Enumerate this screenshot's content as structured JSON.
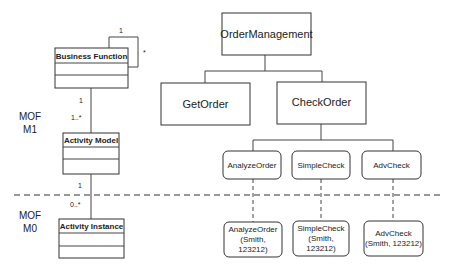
{
  "levels": [
    {
      "line1": "MOF",
      "line2": "M1"
    },
    {
      "line1": "MOF",
      "line2": "M0"
    }
  ],
  "classes": {
    "business_function": "Business Function",
    "activity_model": "Activity Model",
    "activity_instance": "Activity Instance"
  },
  "multiplicities": {
    "self_loop_top": "1",
    "self_loop_side": "*",
    "bf_am_upper": "1",
    "bf_am_lower": "1..*",
    "am_ai_upper": "1",
    "am_ai_lower": "0..*"
  },
  "hierarchy": {
    "root": "OrderManagement",
    "level2": [
      "GetOrder",
      "CheckOrder"
    ],
    "activities": [
      "AnalyzeOrder",
      "SimpleCheck",
      "AdvCheck"
    ],
    "instances": [
      [
        "AnalyzeOrder",
        "(Smith,",
        "123212)"
      ],
      [
        "SimpleCheck",
        "(Smith,",
        "123212)"
      ],
      [
        "AdvCheck",
        "(Smith, 123212)"
      ]
    ]
  }
}
